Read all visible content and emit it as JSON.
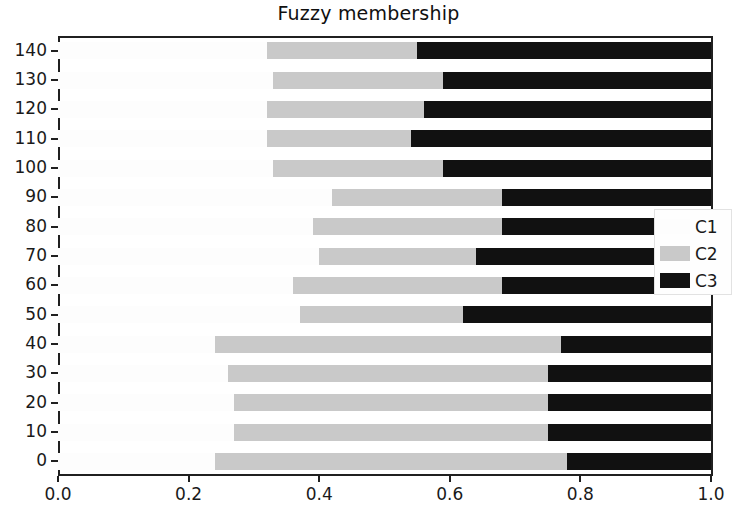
{
  "chart_data": {
    "type": "bar",
    "orientation": "horizontal",
    "stacked": true,
    "title": "Fuzzy membership",
    "xlabel": "",
    "ylabel": "",
    "xlim": [
      0.0,
      1.0
    ],
    "ylim": [
      -5,
      145
    ],
    "grid": false,
    "legend_position": "center right",
    "xticks": [
      "0.0",
      "0.2",
      "0.4",
      "0.6",
      "0.8",
      "1.0"
    ],
    "xtick_values": [
      0.0,
      0.2,
      0.4,
      0.6,
      0.8,
      1.0
    ],
    "categories": [
      0,
      10,
      20,
      30,
      40,
      50,
      60,
      70,
      80,
      90,
      100,
      110,
      120,
      130,
      140
    ],
    "ytick_labels": [
      "0",
      "10",
      "20",
      "30",
      "40",
      "50",
      "60",
      "70",
      "80",
      "90",
      "100",
      "110",
      "120",
      "130",
      "140"
    ],
    "series": [
      {
        "name": "C1",
        "color": "#fdfdfd",
        "values": [
          0.24,
          0.27,
          0.27,
          0.26,
          0.24,
          0.37,
          0.36,
          0.4,
          0.39,
          0.42,
          0.33,
          0.32,
          0.32,
          0.33,
          0.32
        ]
      },
      {
        "name": "C2",
        "color": "#c9c9c9",
        "values": [
          0.54,
          0.48,
          0.48,
          0.49,
          0.53,
          0.25,
          0.32,
          0.24,
          0.29,
          0.26,
          0.26,
          0.22,
          0.24,
          0.26,
          0.23
        ]
      },
      {
        "name": "C3",
        "color": "#111111",
        "values": [
          0.22,
          0.25,
          0.25,
          0.25,
          0.23,
          0.38,
          0.32,
          0.36,
          0.32,
          0.32,
          0.41,
          0.46,
          0.44,
          0.41,
          0.45
        ]
      }
    ],
    "legend_entries": [
      {
        "label": "C1",
        "color": "#fdfdfd"
      },
      {
        "label": "C2",
        "color": "#c9c9c9"
      },
      {
        "label": "C3",
        "color": "#111111"
      }
    ]
  },
  "axes": {
    "x_min": 0.0,
    "x_max": 1.0,
    "bar_height_px": 17,
    "row_spacing_px": 29.6
  }
}
